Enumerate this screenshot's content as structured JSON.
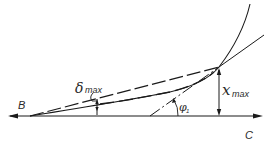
{
  "diagram": {
    "type": "geometry",
    "colors": {
      "line": "#1a1a1a",
      "background": "#ffffff"
    },
    "labels": {
      "B": "B",
      "C": "C",
      "delta_max": {
        "symbol": "δ",
        "subscript": "max"
      },
      "x_max": {
        "symbol": "x",
        "subscript": "max"
      },
      "phi_1": {
        "symbol": "φ",
        "subscript": "1"
      }
    },
    "elements": [
      {
        "name": "axis",
        "style": "solid",
        "arrows": "both",
        "from": "B",
        "to": "C"
      },
      {
        "name": "curve",
        "style": "solid",
        "from": "B",
        "through": "tangent-point"
      },
      {
        "name": "chord",
        "style": "dashed",
        "from": "B",
        "to": "tangent-point"
      },
      {
        "name": "tangent-line",
        "style": "dash-dot / solid",
        "through": "tangent-point"
      },
      {
        "name": "x-max-dimension",
        "style": "double-arrow",
        "orientation": "vertical"
      },
      {
        "name": "delta-max-dimension",
        "style": "marker",
        "orientation": "vertical"
      },
      {
        "name": "phi-1-angle",
        "style": "arc-arrow"
      }
    ]
  }
}
